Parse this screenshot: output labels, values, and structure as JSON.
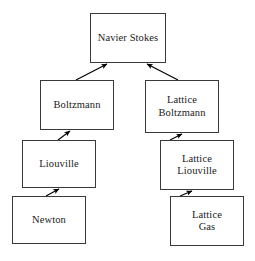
{
  "diagram": {
    "type": "flowchart",
    "colors": {
      "background": "#ffffff",
      "box_border": "#3a3a3a",
      "box_fill": "#ffffff",
      "text": "#1a1a1a",
      "arrow": "#000000"
    },
    "nodes": [
      {
        "id": "navier",
        "label": "Navier Stokes"
      },
      {
        "id": "boltz",
        "label": "Boltzmann"
      },
      {
        "id": "lboltz",
        "label": "Lattice\nBoltzmann"
      },
      {
        "id": "liou",
        "label": "Liouville"
      },
      {
        "id": "lliou",
        "label": "Lattice\nLiouville"
      },
      {
        "id": "newton",
        "label": "Newton"
      },
      {
        "id": "lgas",
        "label": "Lattice\nGas"
      }
    ],
    "edges": [
      {
        "id": "boltz-to-navier",
        "from": "Boltzmann",
        "to": "Navier Stokes",
        "arrowhead": "to"
      },
      {
        "id": "lboltz-to-navier",
        "from": "Lattice Boltzmann",
        "to": "Navier Stokes",
        "arrowhead": "to"
      },
      {
        "id": "liou-to-boltz",
        "from": "Liouville",
        "to": "Boltzmann",
        "arrowhead": "to"
      },
      {
        "id": "newton-to-liou",
        "from": "Newton",
        "to": "Liouville",
        "arrowhead": "to"
      },
      {
        "id": "lliou-to-lboltz",
        "from": "Lattice Liouville",
        "to": "Lattice Boltzmann",
        "arrowhead": "to"
      },
      {
        "id": "lgas-to-lliou",
        "from": "Lattice Gas",
        "to": "Lattice Liouville",
        "arrowhead": "to"
      }
    ]
  }
}
